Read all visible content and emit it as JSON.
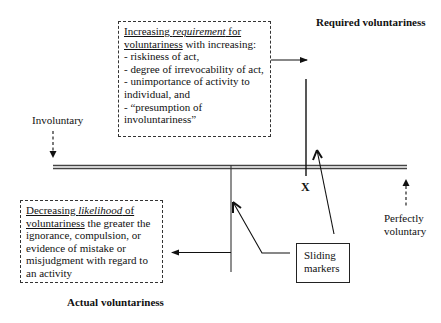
{
  "diagram": {
    "required_title": "Required voluntariness",
    "actual_title": "Actual voluntariness",
    "axis": {
      "left_label": "Involuntary",
      "right_label_line1": "Perfectly",
      "right_label_line2": "voluntary",
      "marker_x_label": "X"
    },
    "requirement_box": {
      "heading_underlined_1": "Increasing ",
      "heading_italic": "requirement",
      "heading_underlined_2": " for",
      "heading_line2_underlined": "voluntariness",
      "heading_line2_rest": " with increasing:",
      "items": [
        "- riskiness of act,",
        "- degree of irrevocability of act,",
        "- unimportance of activity to",
        "individual, and",
        "- “presumption of",
        "involuntariness”"
      ]
    },
    "likelihood_box": {
      "heading_underlined_1": "Decreasing ",
      "heading_italic": "likelihood",
      "heading_underlined_2": " of",
      "heading_line2_underlined": "voluntariness",
      "heading_line2_rest": " the greater the",
      "lines": [
        "ignorance, compulsion, or",
        "evidence of mistake or",
        "misjudgment with regard to",
        "an activity"
      ]
    },
    "sliding_markers_box": {
      "line1": "Sliding",
      "line2": "markers"
    },
    "colors": {
      "line": "#111111",
      "axis": "#555555",
      "background": "#ffffff"
    }
  }
}
